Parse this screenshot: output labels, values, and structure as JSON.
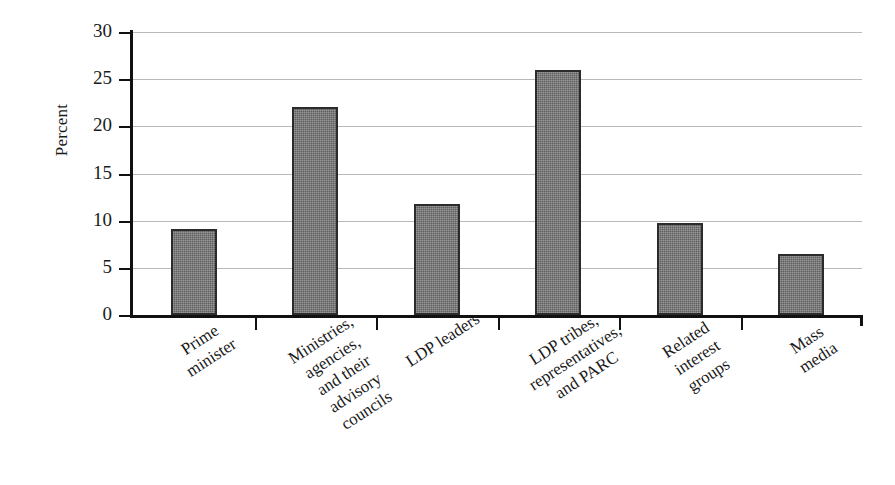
{
  "chart_data": {
    "type": "bar",
    "title": "",
    "xlabel": "",
    "ylabel": "Percent",
    "ylim": [
      0,
      30
    ],
    "yticks": [
      0,
      5,
      10,
      15,
      20,
      25,
      30
    ],
    "ytick_labels": [
      "0",
      "5",
      "10",
      "15",
      "20",
      "25",
      "30"
    ],
    "grid": true,
    "legend": "none",
    "categories": [
      "Prime\nminister",
      "Ministries,\nagencies,\nand their\nadvisory\ncouncils",
      "LDP leaders",
      "LDP  tribes,\nrepresentatives,\nand PARC",
      "Related\ninterest\ngroups",
      "Mass\nmedia"
    ],
    "values": [
      9.1,
      22.0,
      11.8,
      26.0,
      9.8,
      6.5
    ],
    "bar_color": "#767676",
    "bar_border_color": "#2b2b2b",
    "gridline_color": "#b9b9b9",
    "axis_color": "#111111"
  }
}
